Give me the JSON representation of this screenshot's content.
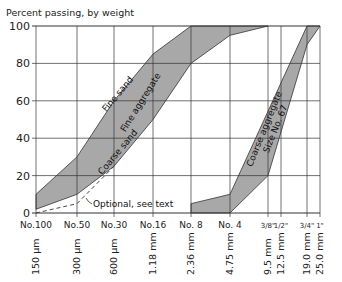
{
  "chart_data": {
    "type": "area",
    "title": "",
    "ylabel": "Percent passing, by weight",
    "xlabel": "",
    "ylim": [
      0,
      100
    ],
    "yticks": [
      0,
      20,
      40,
      60,
      80,
      100
    ],
    "grid": true,
    "sieves": [
      {
        "no": "No.100",
        "size": "150 µm",
        "x": 36
      },
      {
        "no": "No.50",
        "size": "300 µm",
        "x": 77
      },
      {
        "no": "No.30",
        "size": "600 µm",
        "x": 114
      },
      {
        "no": "No.16",
        "size": "1.18 mm",
        "x": 153
      },
      {
        "no": "No. 8",
        "size": "2.36 mm",
        "x": 191
      },
      {
        "no": "No. 4",
        "size": "4.75 mm",
        "x": 230
      },
      {
        "no": "3/8\"",
        "size": "9.5 mm",
        "x": 268
      },
      {
        "no": "1/2\"",
        "size": "12.5 mm",
        "x": 281
      },
      {
        "no": "3/4\"",
        "size": "19.0 mm",
        "x": 307
      },
      {
        "no": "1\"",
        "size": "25.0 mm",
        "x": 320
      }
    ],
    "series": [
      {
        "name": "Fine aggregate (upper limit / Fine sand)",
        "x": [
          "No.100",
          "No.50",
          "No.30",
          "No.16",
          "No. 8"
        ],
        "values": [
          10,
          30,
          60,
          85,
          100
        ]
      },
      {
        "name": "Fine aggregate (lower limit / Coarse sand)",
        "x": [
          "No.100",
          "No.50",
          "No.30",
          "No.16",
          "No. 8",
          "No. 4",
          "3/8\""
        ],
        "values": [
          2,
          10,
          25,
          50,
          80,
          95,
          100
        ]
      },
      {
        "name": "Optional, see text",
        "x": [
          "No.100",
          "No.50",
          "No.30"
        ],
        "values": [
          0,
          5,
          25
        ],
        "style": "dashed"
      },
      {
        "name": "Coarse aggregate Size No. 67 (upper limit)",
        "x": [
          "No. 8",
          "No. 4",
          "3/4\""
        ],
        "values": [
          5,
          10,
          100
        ]
      },
      {
        "name": "Coarse aggregate Size No. 67 (lower limit)",
        "x": [
          "No. 8",
          "No. 4",
          "3/8\"",
          "3/4\"",
          "1\""
        ],
        "values": [
          0,
          0,
          20,
          90,
          100
        ]
      }
    ],
    "annotations": [
      "Fine sand",
      "Fine aggregate",
      "Coarse sand",
      "Optional, see text",
      "Coarse aggregate",
      "Size No. 67"
    ],
    "fill_color": "#a8a8a8"
  }
}
